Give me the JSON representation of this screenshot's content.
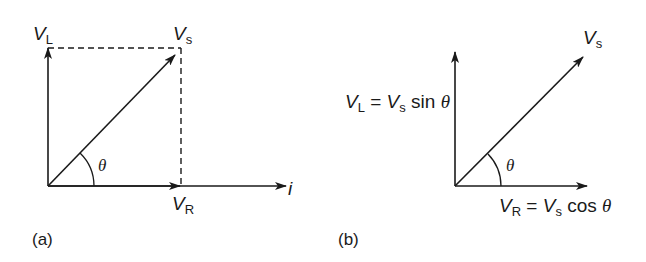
{
  "diagrams": [
    {
      "id": "a",
      "caption": "(a)",
      "labels": {
        "vl_main": "V",
        "vl_sub": "L",
        "vs_main": "V",
        "vs_sub": "s",
        "vr_main": "V",
        "vr_sub": "R",
        "current": "i",
        "angle": "θ"
      }
    },
    {
      "id": "b",
      "caption": "(b)",
      "labels": {
        "vl_eq": {
          "v1": "V",
          "sub1": "L",
          "eq": " = ",
          "v2": "V",
          "sub2": "s",
          "fn": " sin ",
          "ang": "θ"
        },
        "vs_main": "V",
        "vs_sub": "s",
        "vr_eq": {
          "v1": "V",
          "sub1": "R",
          "eq": " = ",
          "v2": "V",
          "sub2": "s",
          "fn": " cos ",
          "ang": "θ"
        },
        "angle": "θ"
      }
    }
  ],
  "colors": {
    "stroke": "#1a1a1a",
    "background": "#ffffff"
  }
}
